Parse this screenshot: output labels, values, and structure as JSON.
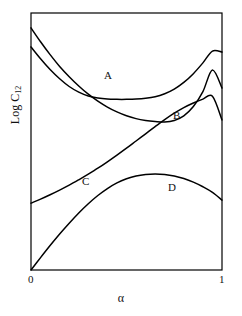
{
  "chart_data": {
    "type": "line",
    "title": "",
    "xlabel": "α",
    "ylabel": "Log C",
    "ylabel_sub": "12",
    "ylabel_full": "Log C12",
    "xlim": [
      0,
      1
    ],
    "xticks": [
      "0",
      "1"
    ],
    "xtick_values": [
      0,
      1
    ],
    "yticks": [],
    "grid": false,
    "legend": "inline-curve-labels",
    "axis_frame": "full-box",
    "line_color": "#000000",
    "background_color": "#ffffff",
    "series": [
      {
        "name": "A",
        "label": "A",
        "shape": "u-shaped minimum",
        "x": [
          0.0,
          0.05,
          0.1,
          0.15,
          0.2,
          0.25,
          0.3,
          0.35,
          0.4,
          0.45,
          0.5,
          0.55,
          0.6,
          0.65,
          0.7,
          0.75,
          0.8,
          0.85,
          0.9,
          0.95,
          1.0
        ],
        "values": [
          0.868,
          0.822,
          0.78,
          0.744,
          0.714,
          0.692,
          0.677,
          0.669,
          0.665,
          0.664,
          0.664,
          0.665,
          0.668,
          0.674,
          0.686,
          0.704,
          0.73,
          0.764,
          0.806,
          0.852,
          0.848
        ]
      },
      {
        "name": "B",
        "label": "B",
        "shape": "steep decline then steep rise",
        "x": [
          0.0,
          0.05,
          0.1,
          0.15,
          0.2,
          0.25,
          0.3,
          0.35,
          0.4,
          0.45,
          0.5,
          0.55,
          0.6,
          0.65,
          0.7,
          0.75,
          0.8,
          0.85,
          0.9,
          0.95,
          1.0
        ],
        "values": [
          0.942,
          0.888,
          0.838,
          0.792,
          0.752,
          0.716,
          0.684,
          0.657,
          0.634,
          0.615,
          0.6,
          0.589,
          0.582,
          0.578,
          0.576,
          0.582,
          0.6,
          0.636,
          0.694,
          0.778,
          0.708
        ]
      },
      {
        "name": "C",
        "label": "C",
        "shape": "monotonic rise, convex",
        "x": [
          0.0,
          0.05,
          0.1,
          0.15,
          0.2,
          0.25,
          0.3,
          0.35,
          0.4,
          0.45,
          0.5,
          0.55,
          0.6,
          0.65,
          0.7,
          0.75,
          0.8,
          0.85,
          0.9,
          0.95,
          1.0
        ],
        "values": [
          0.26,
          0.276,
          0.293,
          0.311,
          0.33,
          0.351,
          0.373,
          0.396,
          0.421,
          0.447,
          0.474,
          0.502,
          0.53,
          0.558,
          0.585,
          0.61,
          0.632,
          0.65,
          0.665,
          0.676,
          0.584
        ]
      },
      {
        "name": "D",
        "label": "D",
        "shape": "rise to broad maximum then fall",
        "x": [
          0.0,
          0.05,
          0.1,
          0.15,
          0.2,
          0.25,
          0.3,
          0.35,
          0.4,
          0.45,
          0.5,
          0.55,
          0.6,
          0.65,
          0.7,
          0.75,
          0.8,
          0.85,
          0.9,
          0.95,
          1.0
        ],
        "values": [
          0.0,
          0.048,
          0.095,
          0.14,
          0.182,
          0.222,
          0.258,
          0.29,
          0.317,
          0.339,
          0.355,
          0.366,
          0.372,
          0.374,
          0.372,
          0.366,
          0.356,
          0.342,
          0.324,
          0.302,
          0.272
        ]
      }
    ]
  }
}
